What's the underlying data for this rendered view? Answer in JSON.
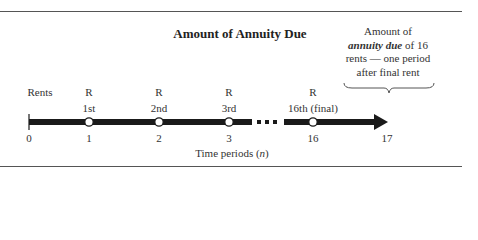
{
  "title": "Amount of Annuity Due",
  "annotation": {
    "line1": "Amount of",
    "line2_em": "annuity due",
    "line2_rest": " of 16",
    "line3": "rents — one period",
    "line4": "after final rent"
  },
  "rents_label": "Rents",
  "payments": [
    {
      "symbol": "R",
      "ordinal": "1st",
      "period": "1"
    },
    {
      "symbol": "R",
      "ordinal": "2nd",
      "period": "2"
    },
    {
      "symbol": "R",
      "ordinal": "3rd",
      "period": "3"
    },
    {
      "symbol": "R",
      "ordinal": "16th (final)",
      "period": "16"
    }
  ],
  "start_period": "0",
  "end_period": "17",
  "axis_label_prefix": "Time periods (",
  "axis_label_var": "n",
  "axis_label_suffix": ")",
  "colors": {
    "line": "#1a1a1a",
    "rule": "#555555",
    "text": "#333333"
  }
}
